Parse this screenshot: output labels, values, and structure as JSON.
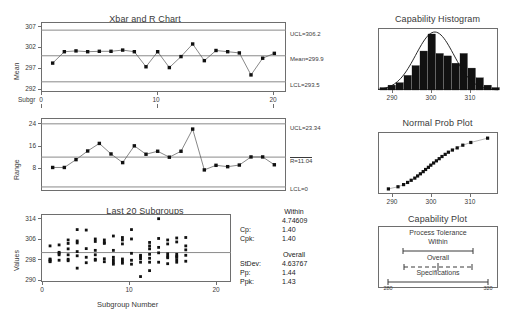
{
  "chart_data": [
    {
      "type": "line",
      "name": "xbar-chart",
      "title": "Xbar and R Chart",
      "ylabel": "Mean",
      "xlabel": "Subgr",
      "yticks": [
        292,
        297,
        302,
        307
      ],
      "ylim": [
        291.0,
        308.2
      ],
      "xticks": [
        0,
        10,
        20
      ],
      "xlim": [
        0,
        21
      ],
      "x": [
        1,
        2,
        3,
        4,
        5,
        6,
        7,
        8,
        9,
        10,
        11,
        12,
        13,
        14,
        15,
        16,
        17,
        18,
        19,
        20
      ],
      "values": [
        298.1,
        300.9,
        301.1,
        300.9,
        301.0,
        301.0,
        301.3,
        300.9,
        297.2,
        300.9,
        297.0,
        299.7,
        302.8,
        298.7,
        301.2,
        300.9,
        300.6,
        295.2,
        299.3,
        300.5
      ],
      "limits": {
        "ucl_label": "UCL=306.2",
        "ucl": 306.2,
        "center_label": "Mean=299.9",
        "center": 299.9,
        "lcl_label": "LCL=293.5",
        "lcl": 293.5
      }
    },
    {
      "type": "line",
      "name": "r-chart",
      "title": "",
      "ylabel": "Range",
      "yticks": [
        8,
        16,
        24
      ],
      "ylim": [
        -1.5,
        25.5
      ],
      "xticks": [
        0,
        10,
        20
      ],
      "xlim": [
        0,
        21
      ],
      "x": [
        1,
        2,
        3,
        4,
        5,
        6,
        7,
        8,
        9,
        10,
        11,
        12,
        13,
        14,
        15,
        16,
        17,
        18,
        19,
        20
      ],
      "values": [
        7.2,
        7.2,
        10.1,
        13.3,
        16.1,
        12.2,
        9.0,
        15.2,
        12.1,
        13.2,
        11.0,
        13.2,
        21.4,
        6.3,
        8.0,
        7.5,
        8.1,
        11.1,
        11.1,
        8.2
      ],
      "limits": {
        "ucl_label": "UCL=23.34",
        "ucl": 23.34,
        "center_label": "R=11.04",
        "center": 11.04,
        "lcl_label": "LCL=0",
        "lcl": 0
      }
    },
    {
      "type": "scatter",
      "name": "last-20-subgroups",
      "title": "Last 20 Subgroups",
      "ylabel": "Values",
      "xlabel": "Subgroup Number",
      "yticks": [
        290,
        298,
        306,
        314
      ],
      "ylim": [
        288,
        315.5
      ],
      "xticks": [
        0,
        10,
        20
      ],
      "xlim": [
        0,
        21
      ],
      "center": 299.9,
      "groups": [
        {
          "x": 1,
          "values": [
            302.6,
            297.3,
            297.0,
            296.4,
            296.2
          ]
        },
        {
          "x": 2,
          "values": [
            303.0,
            300.0,
            299.6,
            299.0,
            296.8
          ]
        },
        {
          "x": 3,
          "values": [
            305.0,
            303.6,
            301.4,
            299.0,
            297.2,
            296.6
          ]
        },
        {
          "x": 4,
          "values": [
            309.2,
            304.6,
            303.8,
            300.3,
            298.6,
            293.6
          ]
        },
        {
          "x": 5,
          "values": [
            309.0,
            301.5,
            298.0,
            295.8
          ]
        },
        {
          "x": 6,
          "values": [
            305.4,
            304.4,
            300.8,
            299.0,
            297.2,
            296.8
          ]
        },
        {
          "x": 7,
          "values": [
            305.0,
            304.0,
            303.6,
            297.4,
            296.2
          ]
        },
        {
          "x": 8,
          "values": [
            306.6,
            300.8,
            298.0,
            297.0,
            296.0,
            295.2
          ]
        },
        {
          "x": 9,
          "values": [
            306.0,
            305.0,
            303.4,
            297.3,
            296.4,
            295.6
          ]
        },
        {
          "x": 10,
          "values": [
            309.2,
            305.4,
            299.6,
            296.8,
            295.2
          ]
        },
        {
          "x": 11,
          "values": [
            298.8,
            298.2,
            297.4,
            296.0,
            290.2
          ]
        },
        {
          "x": 12,
          "values": [
            304.0,
            302.6,
            301.4,
            299.2,
            297.6,
            296.0,
            292.6
          ]
        },
        {
          "x": 13,
          "values": [
            313.6,
            305.6,
            302.0,
            299.8,
            296.0
          ]
        },
        {
          "x": 14,
          "values": [
            305.0,
            303.4,
            299.4,
            298.4,
            297.8,
            295.4
          ]
        },
        {
          "x": 15,
          "values": [
            305.8,
            304.2,
            299.2,
            298.4,
            298.0,
            297.0,
            296.0
          ]
        },
        {
          "x": 16,
          "values": [
            306.0,
            302.6,
            301.0,
            298.8,
            296.4
          ]
        }
      ]
    },
    {
      "type": "bar",
      "name": "capability-histogram",
      "title": "Capability Histogram",
      "xticks": [
        290,
        300,
        310
      ],
      "xlim": [
        286,
        316
      ],
      "bin_centers": [
        287.5,
        289.5,
        291.5,
        293.5,
        295.5,
        297.5,
        299.5,
        301.5,
        303.5,
        305.5,
        307.5,
        309.5,
        311.5,
        313.5,
        315.5
      ],
      "values": [
        1,
        2,
        3,
        6,
        10,
        16,
        23,
        15,
        14,
        11,
        15,
        9,
        5,
        2,
        1
      ],
      "curve_overlay": true
    },
    {
      "type": "scatter",
      "name": "normal-prob-plot",
      "title": "Normal Prob Plot",
      "xticks": [
        290,
        300,
        310
      ],
      "xlim": [
        286,
        316
      ],
      "x": [
        288.6,
        291.0,
        292.4,
        293.4,
        294.3,
        295.2,
        295.9,
        296.6,
        297.3,
        297.9,
        298.6,
        299.2,
        299.9,
        300.6,
        301.3,
        302.0,
        302.8,
        303.6,
        304.6,
        305.8,
        307.2,
        309.2,
        313.4
      ],
      "y": [
        0.02,
        0.06,
        0.1,
        0.14,
        0.18,
        0.22,
        0.26,
        0.3,
        0.34,
        0.38,
        0.42,
        0.46,
        0.5,
        0.54,
        0.58,
        0.62,
        0.66,
        0.7,
        0.74,
        0.78,
        0.83,
        0.88,
        0.96
      ]
    }
  ],
  "panels": {
    "xbar": {
      "title": "Xbar and R Chart",
      "ylabel": "Mean",
      "xlabel": "Subgr",
      "ucl": "UCL=306.2",
      "center": "Mean=299.9",
      "lcl": "LCL=293.5",
      "yticks": [
        "307",
        "302",
        "297",
        "292"
      ],
      "xticks": [
        "0",
        "10",
        "20"
      ]
    },
    "range": {
      "ylabel": "Range",
      "ucl": "UCL=23.34",
      "center": "R=11.04",
      "lcl": "LCL=0",
      "yticks": [
        "24",
        "16",
        "8"
      ],
      "xticks": [
        "0",
        "10",
        "20"
      ]
    },
    "last20": {
      "title": "Last 20 Subgroups",
      "ylabel": "Values",
      "xlabel": "Subgroup Number",
      "yticks": [
        "314",
        "306",
        "298",
        "290"
      ],
      "xticks": [
        "0",
        "10",
        "20"
      ]
    },
    "histogram": {
      "title": "Capability Histogram",
      "xticks": [
        "290",
        "300",
        "310"
      ]
    },
    "probplot": {
      "title": "Normal Prob Plot",
      "xticks": [
        "290",
        "300",
        "310"
      ]
    },
    "capplot": {
      "title": "Capability Plot",
      "process_tolerance": "Process Tolerance",
      "within": "Within",
      "overall": "Overall",
      "specifications": "Specifications",
      "spec_low": "280",
      "spec_high": "320"
    }
  },
  "stats": {
    "within_heading": "Within",
    "within_stdev": "4.74609",
    "cp_label": "Cp:",
    "cp_value": "1.40",
    "cpk_label": "Cpk:",
    "cpk_value": "1.40",
    "overall_heading": "Overall",
    "stdev_label": "StDev:",
    "stdev_value": "4.63767",
    "pp_label": "Pp:",
    "pp_value": "1.44",
    "ppk_label": "Ppk:",
    "ppk_value": "1.43"
  }
}
